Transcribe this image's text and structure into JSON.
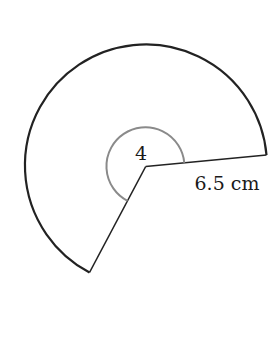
{
  "diagram": {
    "type": "sector",
    "angle_label": "4",
    "radius_label": "6.5 cm",
    "colors": {
      "outline": "#222222",
      "angle_arc": "#8a8a8a",
      "background": "#ffffff"
    }
  }
}
